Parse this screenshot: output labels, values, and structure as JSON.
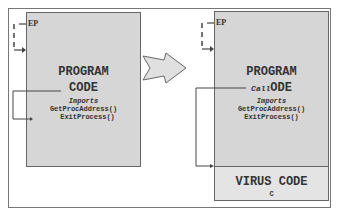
{
  "before": {
    "entry_point_label": "EP",
    "program_title_line1": "PROGRAM",
    "program_title_line2": "CODE",
    "imports_label": "Imports",
    "import_1": "GetProcAddress()",
    "import_2": "ExitProcess()"
  },
  "after": {
    "entry_point_label": "EP",
    "program_title_line1": "PROGRAM",
    "call_label": "Call",
    "program_title_line2_rest": "ODE",
    "imports_label": "Imports",
    "import_1": "GetProcAddress()",
    "import_2": "ExitProcess()",
    "virus_title": "VIRUS CODE",
    "virus_sub": "C"
  },
  "colors": {
    "box_fill": "#d6d6d6",
    "virus_fill": "#e4e4e4",
    "line": "#555555"
  }
}
